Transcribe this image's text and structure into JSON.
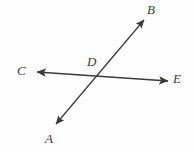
{
  "figure": {
    "background_color": "#fefefe",
    "line_color": "#3a3a3a",
    "label_color": "#3b3b3b",
    "width": 193,
    "height": 152,
    "labels": {
      "A": "A",
      "B": "B",
      "C": "C",
      "D": "D",
      "E": "E"
    },
    "points": {
      "A": {
        "x": 50,
        "y": 140
      },
      "B": {
        "x": 152,
        "y": 10
      },
      "C": {
        "x": 22,
        "y": 71
      },
      "D": {
        "x": 92,
        "y": 62
      },
      "E": {
        "x": 178,
        "y": 79
      },
      "intersection": {
        "x": 98,
        "y": 78
      }
    },
    "segments": [
      {
        "name": "line-AB",
        "from": "A",
        "to": "B",
        "x1": 56,
        "y1": 124,
        "x2": 144,
        "y2": 20,
        "arrow_start": true,
        "arrow_end": true
      },
      {
        "name": "line-CE",
        "from": "C",
        "to": "E",
        "x1": 37,
        "y1": 72,
        "x2": 168,
        "y2": 81,
        "arrow_start": true,
        "arrow_end": true
      }
    ]
  }
}
